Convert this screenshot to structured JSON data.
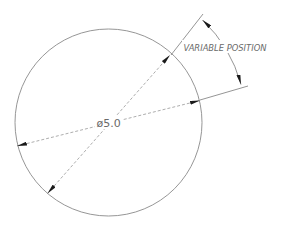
{
  "drawing": {
    "type": "engineering-dimension-drawing",
    "circle": {
      "cx": 108.5,
      "cy": 122.5,
      "r": 93.5,
      "stroke": "#8a8a8a"
    },
    "diameter_label": "ø5.0",
    "angular_label": "VARIABLE POSITION",
    "line_color": "#7a7a7a",
    "arrow_color": "#1a1a1a",
    "text_color": "#6a6a6a"
  }
}
